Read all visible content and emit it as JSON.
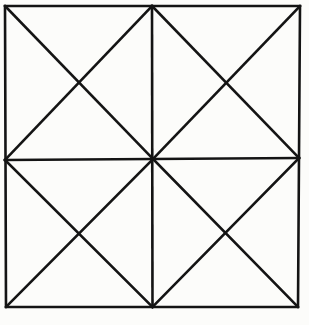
{
  "page": {
    "background_color": "#fcfcfa",
    "width": 309,
    "height": 325,
    "ghost_text_1": "",
    "ghost_text_2": ""
  },
  "figure": {
    "stroke_color": "#141414",
    "stroke_width": 2.6,
    "fill_color": "none",
    "triangle_count": "16",
    "outer_square": {
      "top_left": "5,6",
      "top_right": "300,6",
      "bottom_right": "298,307",
      "bottom_left": "6,307"
    },
    "midpoints": {
      "top": "152,6",
      "right": "299,158",
      "bottom": "152,307",
      "left": "5,160",
      "center": "153,159"
    },
    "quadrant_crossings": {
      "top_left": "79,85",
      "top_right": "226,83",
      "bottom_left": "79,233",
      "bottom_right": "225,233"
    }
  },
  "geometry": {
    "outline_points": "5,6 300,6 298,307 6,307",
    "grid_vertical": {
      "x1": 152,
      "y1": 6,
      "x2": 152.5,
      "y2": 307
    },
    "grid_horizontal": {
      "x1": 5,
      "y1": 160,
      "x2": 299,
      "y2": 158
    },
    "diagonals": [
      {
        "name": "tl-quadrant-main",
        "x1": 5,
        "y1": 6,
        "x2": 153,
        "y2": 159
      },
      {
        "name": "tl-quadrant-anti",
        "x1": 152,
        "y1": 6,
        "x2": 5,
        "y2": 160
      },
      {
        "name": "tr-quadrant-main",
        "x1": 152,
        "y1": 6,
        "x2": 299,
        "y2": 158
      },
      {
        "name": "tr-quadrant-anti",
        "x1": 300,
        "y1": 6,
        "x2": 153,
        "y2": 159
      },
      {
        "name": "bl-quadrant-main",
        "x1": 5,
        "y1": 160,
        "x2": 152.5,
        "y2": 307
      },
      {
        "name": "bl-quadrant-anti",
        "x1": 153,
        "y1": 159,
        "x2": 6,
        "y2": 307
      },
      {
        "name": "br-quadrant-main",
        "x1": 153,
        "y1": 159,
        "x2": 298,
        "y2": 307
      },
      {
        "name": "br-quadrant-anti",
        "x1": 299,
        "y1": 158,
        "x2": 152.5,
        "y2": 307
      }
    ]
  }
}
